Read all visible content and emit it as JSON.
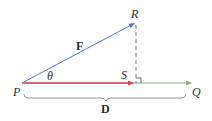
{
  "diagram": {
    "type": "vector-projection",
    "points": {
      "P": {
        "label": "P",
        "x": 22,
        "y": 83
      },
      "R": {
        "label": "R",
        "x": 136,
        "y": 22
      },
      "S": {
        "label": "S",
        "x": 136,
        "y": 83
      },
      "Q": {
        "label": "Q",
        "x": 192,
        "y": 83
      }
    },
    "labels": {
      "force": "F",
      "angle": "θ",
      "displacement": "D",
      "P": "P",
      "Q": "Q",
      "R": "R",
      "S": "S"
    },
    "colors": {
      "force_vector": "#4a78c8",
      "projection_vector": "#d9464a",
      "displacement_line": "#8aa87a",
      "dashed_perpendicular": "#555555",
      "brace": "#777777",
      "text": "#2a2a2a"
    },
    "edges": [
      {
        "from": "P",
        "to": "R",
        "style": "arrow",
        "color_key": "force_vector",
        "label": "F"
      },
      {
        "from": "P",
        "to": "S",
        "style": "arrow",
        "color_key": "projection_vector"
      },
      {
        "from": "P",
        "to": "Q",
        "style": "arrow",
        "color_key": "displacement_line"
      },
      {
        "from": "R",
        "to": "S",
        "style": "dashed",
        "color_key": "dashed_perpendicular"
      }
    ],
    "right_angle_at": "S",
    "brace": {
      "from": "P",
      "to": "Q",
      "label": "D"
    }
  }
}
